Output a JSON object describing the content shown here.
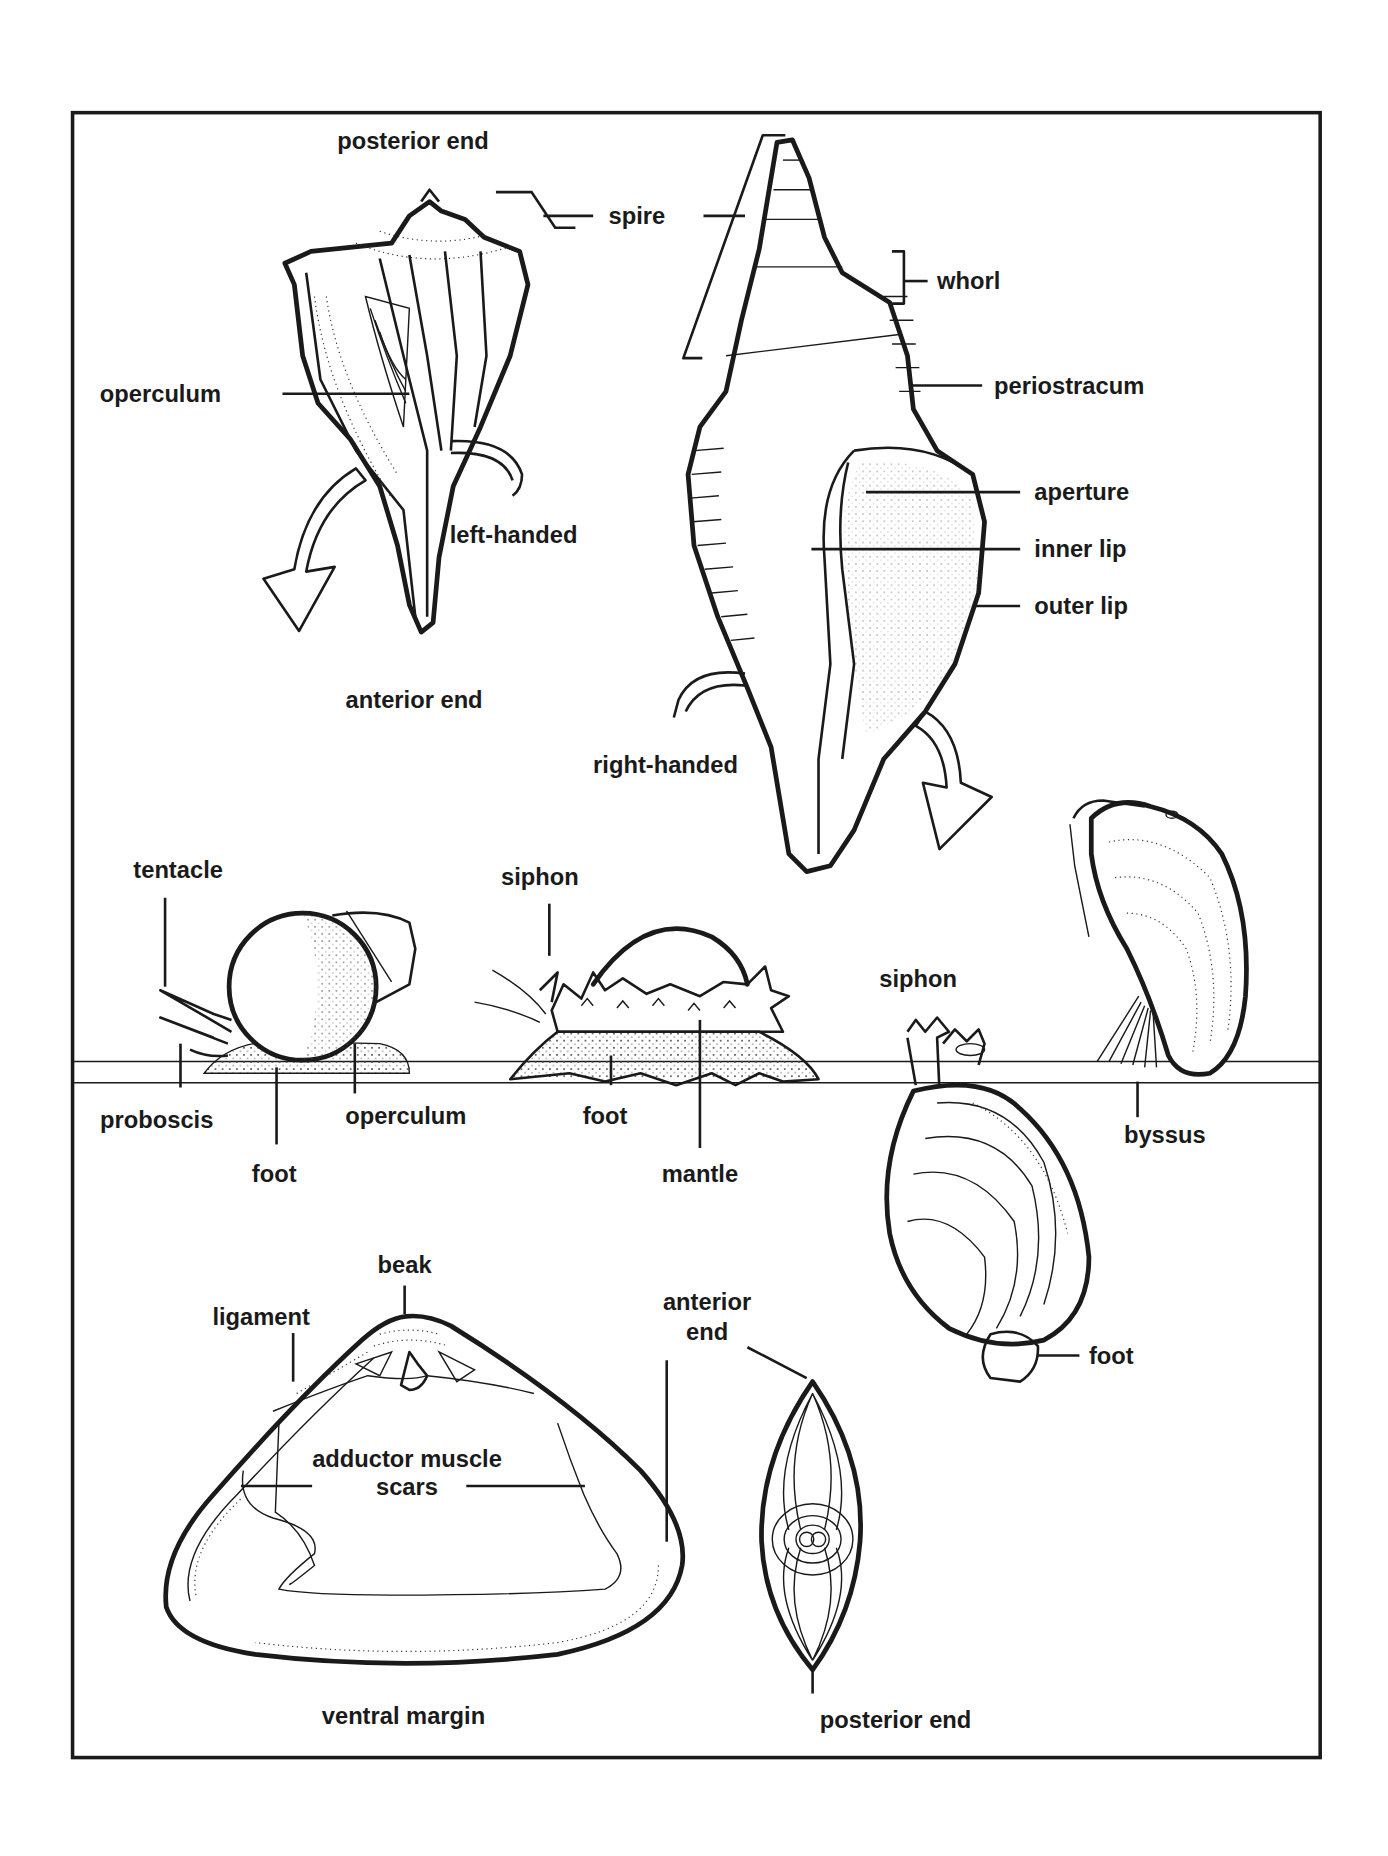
{
  "figure": {
    "frame": {
      "border_color": "#1a1a1a",
      "background": "#ffffff"
    }
  },
  "whelk_left": {
    "posterior_end": "posterior end",
    "spire": "spire",
    "operculum": "operculum",
    "left_handed": "left-handed",
    "anterior_end": "anterior end"
  },
  "whelk_right": {
    "whorl": "whorl",
    "periostracum": "periostracum",
    "aperture": "aperture",
    "inner_lip": "inner lip",
    "outer_lip": "outer lip",
    "right_handed": "right-handed"
  },
  "snail": {
    "tentacle": "tentacle",
    "proboscis": "proboscis",
    "foot": "foot",
    "operculum": "operculum"
  },
  "limpet": {
    "siphon": "siphon",
    "foot": "foot",
    "mantle": "mantle"
  },
  "clam": {
    "siphon": "siphon",
    "foot": "foot"
  },
  "mussel": {
    "byssus": "byssus"
  },
  "bivalve_interior": {
    "beak": "beak",
    "ligament": "ligament",
    "adductor_line1": "adductor muscle",
    "adductor_line2": "scars",
    "ventral_margin": "ventral margin"
  },
  "bivalve_end_view": {
    "anterior_line1": "anterior",
    "anterior_line2": "end",
    "posterior_end": "posterior end"
  }
}
